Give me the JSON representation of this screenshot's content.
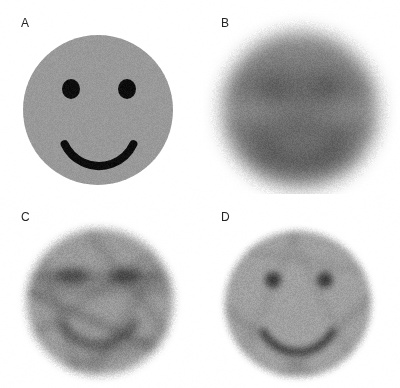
{
  "figure": {
    "width": 400,
    "height": 388,
    "background_color": "#ffffff",
    "layout": "2x2 panel grid",
    "panel_count": 4
  },
  "panels": [
    {
      "id": "a",
      "label": "A",
      "name": "panel-a-ground-truth-phantom",
      "content": "smiley-face-phantom",
      "description": "Sharp binary smiley face phantom: uniform mid-gray disk on white background with two black circular eyes and a black arc smile.",
      "face_fill": "#999999",
      "feature_fill": "#0d0d0d",
      "background_color": "#ffffff",
      "blur_px": 0,
      "noise_amplitude": 7,
      "geometry": {
        "face_center_x": 98,
        "face_center_y": 110,
        "face_radius": 75,
        "eye_left_x": 71,
        "eye_right_x": 127,
        "eye_y": 89,
        "eye_radius_x": 9,
        "eye_radius_y": 10,
        "mouth_center_x": 99,
        "mouth_center_y": 128,
        "mouth_radius": 38,
        "mouth_thickness": 8,
        "mouth_start_deg": 25,
        "mouth_end_deg": 155
      },
      "streaks": []
    },
    {
      "id": "b",
      "label": "B",
      "name": "panel-b-low-angle-reconstruction",
      "content": "blurred-hexagonal-reconstruction",
      "description": "Severely blurred reconstruction from very few projection angles. The disk degenerates into a soft hexagonal blob with strong horizontal banding; facial features are not recoverable.",
      "face_fill": "#8f8f8f",
      "feature_fill": "#6a6a6a",
      "background_color": "#ffffff",
      "blur_px": 9,
      "noise_amplitude": 9,
      "geometry": {
        "face_center_x": 100,
        "face_center_y": 110,
        "face_radius": 78,
        "eye_left_x": 72,
        "eye_right_x": 128,
        "eye_y": 88,
        "eye_radius_x": 12,
        "eye_radius_y": 11,
        "mouth_center_x": 100,
        "mouth_center_y": 124,
        "mouth_radius": 42,
        "mouth_thickness": 16,
        "mouth_start_deg": 20,
        "mouth_end_deg": 160
      },
      "streaks": [
        {
          "angle_deg": 0,
          "offset": -24,
          "width": 28,
          "opacity": 0.3
        },
        {
          "angle_deg": 0,
          "offset": 18,
          "width": 12,
          "opacity": 0.34
        },
        {
          "angle_deg": 0,
          "offset": 44,
          "width": 30,
          "opacity": 0.26
        },
        {
          "angle_deg": 60,
          "offset": 0,
          "width": 46,
          "opacity": 0.14
        },
        {
          "angle_deg": -60,
          "offset": 0,
          "width": 46,
          "opacity": 0.14
        }
      ]
    },
    {
      "id": "c",
      "label": "C",
      "name": "panel-c-intermediate-reconstruction",
      "content": "streaky-partial-reconstruction",
      "description": "Intermediate reconstruction with a moderate number of projections. The circular support is recovered and the eyes and mouth appear as smeared dark bands, but prominent diagonal streak artifacts cross the field.",
      "face_fill": "#9a9a9a",
      "feature_fill": "#565656",
      "background_color": "#ffffff",
      "blur_px": 4,
      "noise_amplitude": 11,
      "geometry": {
        "face_center_x": 100,
        "face_center_y": 108,
        "face_radius": 73,
        "eye_left_x": 72,
        "eye_right_x": 126,
        "eye_y": 82,
        "eye_radius_x": 17,
        "eye_radius_y": 8,
        "mouth_center_x": 98,
        "mouth_center_y": 110,
        "mouth_radius": 41,
        "mouth_thickness": 9,
        "mouth_start_deg": 28,
        "mouth_end_deg": 150
      },
      "streaks": [
        {
          "angle_deg": 0,
          "offset": -25,
          "width": 9,
          "opacity": 0.38
        },
        {
          "angle_deg": 0,
          "offset": -12,
          "width": 7,
          "opacity": 0.26
        },
        {
          "angle_deg": 24,
          "offset": 20,
          "width": 6,
          "opacity": 0.42
        },
        {
          "angle_deg": -34,
          "offset": -10,
          "width": 6,
          "opacity": 0.24
        },
        {
          "angle_deg": 52,
          "offset": -34,
          "width": 7,
          "opacity": 0.22
        },
        {
          "angle_deg": -58,
          "offset": 30,
          "width": 8,
          "opacity": 0.22
        },
        {
          "angle_deg": 72,
          "offset": 42,
          "width": 7,
          "opacity": 0.18
        },
        {
          "angle_deg": -18,
          "offset": 52,
          "width": 9,
          "opacity": 0.2
        }
      ]
    },
    {
      "id": "d",
      "label": "D",
      "name": "panel-d-full-reconstruction",
      "content": "recovered-smiley-reconstruction",
      "description": "Best reconstruction using the full set of projections. The smiley face is clearly recovered: both eyes are compact dark dots and the smile arc is continuous, with only faint residual streaking and noise.",
      "face_fill": "#a0a0a0",
      "feature_fill": "#3a3a3a",
      "background_color": "#ffffff",
      "blur_px": 3,
      "noise_amplitude": 10,
      "geometry": {
        "face_center_x": 98,
        "face_center_y": 110,
        "face_radius": 73,
        "eye_left_x": 73,
        "eye_right_x": 125,
        "eye_y": 86,
        "eye_radius_x": 8,
        "eye_radius_y": 8,
        "mouth_center_x": 98,
        "mouth_center_y": 118,
        "mouth_radius": 40,
        "mouth_thickness": 7,
        "mouth_start_deg": 30,
        "mouth_end_deg": 150
      },
      "streaks": [
        {
          "angle_deg": 38,
          "offset": 48,
          "width": 8,
          "opacity": 0.16
        },
        {
          "angle_deg": -42,
          "offset": 44,
          "width": 8,
          "opacity": 0.16
        },
        {
          "angle_deg": 10,
          "offset": -44,
          "width": 7,
          "opacity": 0.1
        },
        {
          "angle_deg": -66,
          "offset": -30,
          "width": 7,
          "opacity": 0.1
        },
        {
          "angle_deg": 64,
          "offset": -24,
          "width": 7,
          "opacity": 0.09
        }
      ]
    }
  ]
}
